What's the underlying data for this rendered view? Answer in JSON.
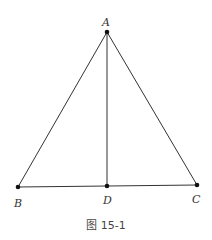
{
  "figure": {
    "caption": "图 15-1",
    "points": {
      "A": {
        "label": "A",
        "x": 107,
        "y": 32
      },
      "B": {
        "label": "B",
        "x": 18,
        "y": 187
      },
      "C": {
        "label": "C",
        "x": 197,
        "y": 185
      },
      "D": {
        "label": "D",
        "x": 107,
        "y": 186
      }
    },
    "segments": [
      "AB",
      "AC",
      "BC",
      "AD"
    ],
    "line_color": "#333333"
  }
}
